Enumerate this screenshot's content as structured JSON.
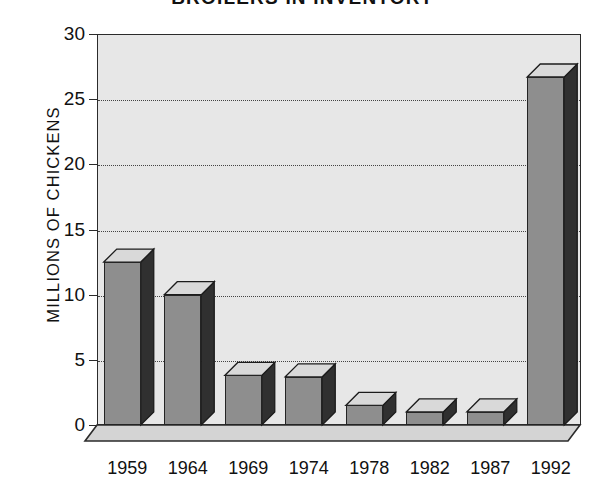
{
  "chart_data": {
    "type": "bar",
    "title": "BROILERS IN INVENTORY",
    "xlabel": "",
    "ylabel": "MILLIONS OF CHICKENS",
    "categories": [
      "1959",
      "1964",
      "1969",
      "1974",
      "1978",
      "1982",
      "1987",
      "1992"
    ],
    "values": [
      12.5,
      10.0,
      3.8,
      3.7,
      1.5,
      1.0,
      1.0,
      26.7
    ],
    "ylim": [
      0,
      30
    ],
    "yticks": [
      0,
      5,
      10,
      15,
      20,
      25,
      30
    ],
    "ytick_labels": [
      "0",
      "5",
      "10",
      "15",
      "20",
      "25",
      "30"
    ],
    "grid": true,
    "grid_axis": "y",
    "grid_style": "dotted",
    "legend": false,
    "style": "3d-bar",
    "colors": {
      "bar_front": "#8e8e8e",
      "bar_side": "#303030",
      "bar_top": "#d9d9d9",
      "plot_background": "#e7e7e7",
      "floor": "#d0d0d0",
      "axis": "#2b2b2b",
      "grid": "#444444",
      "text": "#111111",
      "page_background": "#ffffff"
    }
  },
  "axes": {
    "y_title": "MILLIONS OF CHICKENS",
    "ticks_y": [
      {
        "label": "30",
        "value": 30
      },
      {
        "label": "25",
        "value": 25
      },
      {
        "label": "20",
        "value": 20
      },
      {
        "label": "15",
        "value": 15
      },
      {
        "label": "10",
        "value": 10
      },
      {
        "label": "5",
        "value": 5
      },
      {
        "label": "0",
        "value": 0
      }
    ],
    "ticks_x": [
      {
        "label": "1959"
      },
      {
        "label": "1964"
      },
      {
        "label": "1969"
      },
      {
        "label": "1974"
      },
      {
        "label": "1978"
      },
      {
        "label": "1982"
      },
      {
        "label": "1987"
      },
      {
        "label": "1992"
      }
    ]
  },
  "header": {
    "title": "BROILERS IN INVENTORY"
  }
}
